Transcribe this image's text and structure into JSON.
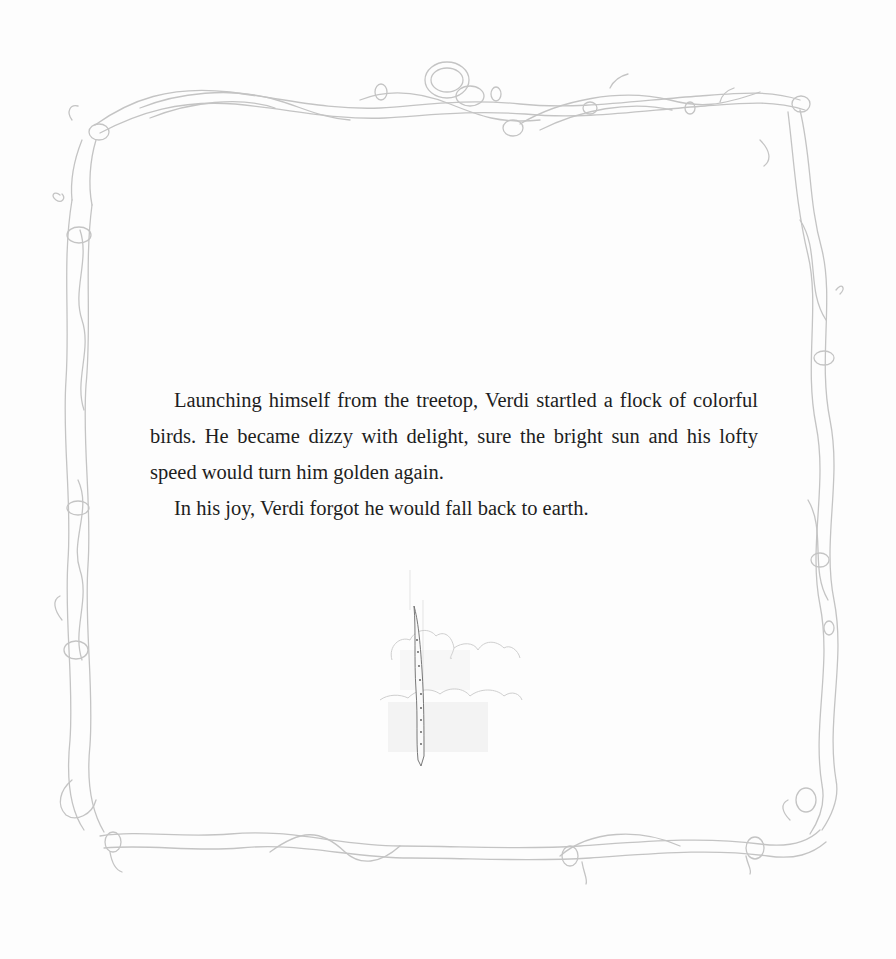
{
  "page": {
    "background_color": "#fdfdfd",
    "border": {
      "type": "twisted-vine-frame",
      "line_color": "#c4c4c4"
    },
    "text_color": "#1e1e1e"
  },
  "story": {
    "paragraphs": [
      "Launching himself from the treetop, Verdi startled a flock of colorful birds. He became dizzy with delight, sure the bright sun and his lofty speed would turn him golden again.",
      "In his joy, Verdi forgot he would fall back to earth."
    ]
  },
  "illustration": {
    "subject": "falling-caterpillar-among-clouds"
  }
}
